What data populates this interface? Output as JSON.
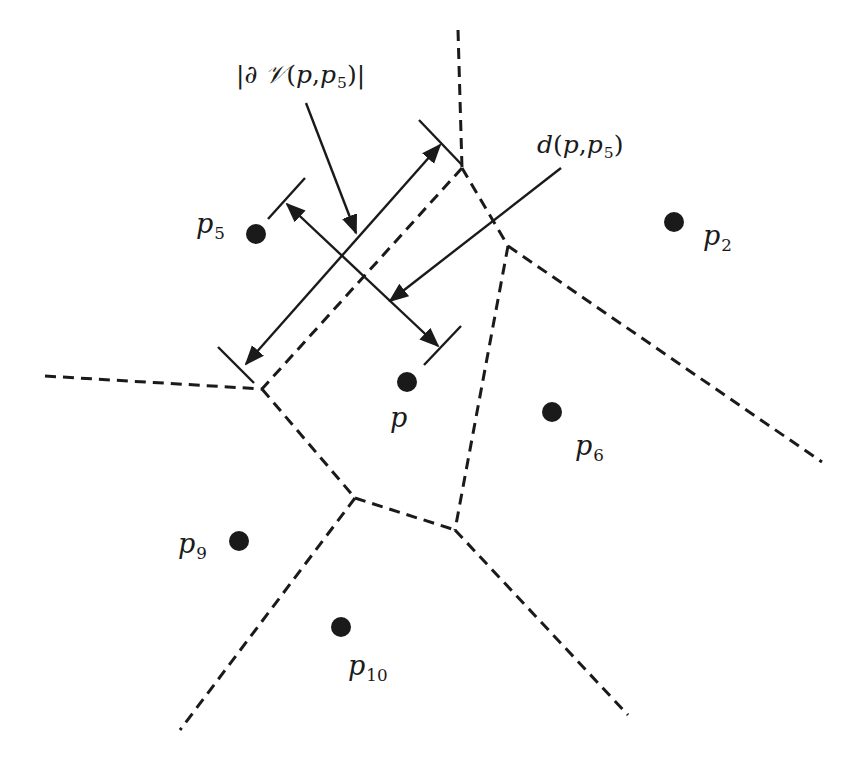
{
  "diagram": {
    "type": "voronoi-cell-illustration",
    "colors": {
      "background": "#ffffff",
      "ink": "#1a1a1a"
    },
    "sites": [
      {
        "id": "p",
        "label": "p",
        "sub": "",
        "x": 407,
        "y": 382,
        "lx": 390,
        "ly": 404
      },
      {
        "id": "p2",
        "label": "p",
        "sub": "2",
        "x": 674,
        "y": 222,
        "lx": 703,
        "ly": 222
      },
      {
        "id": "p5",
        "label": "p",
        "sub": "5",
        "x": 256,
        "y": 234,
        "lx": 196,
        "ly": 210
      },
      {
        "id": "p6",
        "label": "p",
        "sub": "6",
        "x": 552,
        "y": 412,
        "lx": 575,
        "ly": 432
      },
      {
        "id": "p9",
        "label": "p",
        "sub": "9",
        "x": 239,
        "y": 541,
        "lx": 178,
        "ly": 530
      },
      {
        "id": "p10",
        "label": "p",
        "sub": "10",
        "x": 341,
        "y": 627,
        "lx": 348,
        "ly": 652
      }
    ],
    "edges": [
      {
        "x1": 458,
        "y1": 30,
        "x2": 462,
        "y2": 168
      },
      {
        "x1": 462,
        "y1": 168,
        "x2": 508,
        "y2": 246
      },
      {
        "x1": 462,
        "y1": 168,
        "x2": 262,
        "y2": 389
      },
      {
        "x1": 45,
        "y1": 376,
        "x2": 262,
        "y2": 389
      },
      {
        "x1": 262,
        "y1": 389,
        "x2": 355,
        "y2": 498
      },
      {
        "x1": 508,
        "y1": 246,
        "x2": 822,
        "y2": 462
      },
      {
        "x1": 508,
        "y1": 246,
        "x2": 455,
        "y2": 530
      },
      {
        "x1": 355,
        "y1": 498,
        "x2": 455,
        "y2": 530
      },
      {
        "x1": 355,
        "y1": 498,
        "x2": 180,
        "y2": 730
      },
      {
        "x1": 455,
        "y1": 530,
        "x2": 628,
        "y2": 715
      }
    ],
    "dimension_arrows": [
      {
        "name": "boundary-length-arrow",
        "x1": 246,
        "y1": 364,
        "x2": 440,
        "y2": 145,
        "ticks": [
          {
            "x1": 218,
            "y1": 347,
            "x2": 254,
            "y2": 383
          },
          {
            "x1": 419,
            "y1": 120,
            "x2": 462,
            "y2": 165
          }
        ]
      },
      {
        "name": "distance-arrow",
        "x1": 287,
        "y1": 204,
        "x2": 438,
        "y2": 346,
        "ticks": [
          {
            "x1": 268,
            "y1": 219,
            "x2": 305,
            "y2": 178
          },
          {
            "x1": 424,
            "y1": 365,
            "x2": 461,
            "y2": 326
          }
        ]
      }
    ],
    "pointers": [
      {
        "name": "boundary-pointer",
        "x1": 306,
        "y1": 103,
        "x2": 356,
        "y2": 233
      },
      {
        "name": "distance-pointer",
        "x1": 561,
        "y1": 168,
        "x2": 390,
        "y2": 301
      }
    ],
    "annotations": {
      "boundary": {
        "bar_left": "|",
        "partial": "∂",
        "space": " ",
        "cell": "𝒱",
        "open": "(",
        "arg1": "p",
        "comma": ",",
        "arg2": "p",
        "arg2_sub": "5",
        "close": ")",
        "bar_right": "|",
        "x": 236,
        "y": 62
      },
      "distance": {
        "func": "d",
        "open": "(",
        "arg1": "p",
        "comma": ",",
        "arg2": "p",
        "arg2_sub": "5",
        "close": ")",
        "x": 537,
        "y": 132
      }
    }
  }
}
